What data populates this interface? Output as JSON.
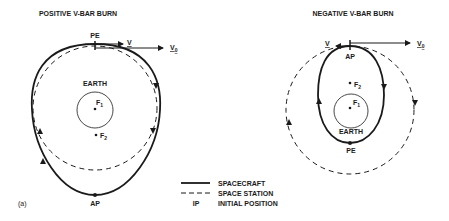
{
  "left_diagram": {
    "title": "POSITIVE V-BAR BURN",
    "pe_label": "PE",
    "ap_label": "AP",
    "earth_label": "EARTH",
    "f1": "F",
    "f1_sub": "1",
    "f2": "F",
    "f2_sub": "2",
    "v_label": "V",
    "v0_label": "V",
    "v0_sub": "0",
    "panel_label": "(a)"
  },
  "right_diagram": {
    "title": "NEGATIVE V-BAR BURN",
    "ap_label": "AP",
    "pe_label": "PE",
    "earth_label": "EARTH",
    "f1": "F",
    "f1_sub": "1",
    "f2": "F",
    "f2_sub": "2",
    "v_label": "V",
    "v0_label": "V",
    "v0_sub": "0"
  },
  "legend": {
    "items": [
      {
        "symbol": "solid-line",
        "label": "SPACECRAFT"
      },
      {
        "symbol": "dashed-line",
        "label": "SPACE STATION"
      },
      {
        "symbol": "IP",
        "label": "INITIAL POSITION"
      }
    ]
  },
  "colors": {
    "ink": "#1a1a1a",
    "background": "#ffffff"
  }
}
